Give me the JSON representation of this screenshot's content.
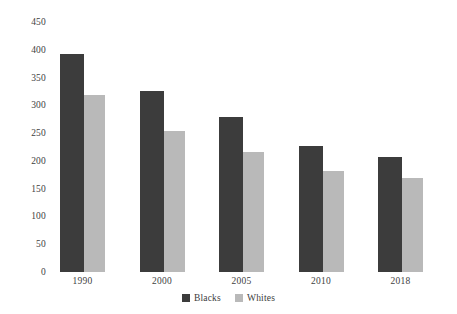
{
  "chart_data": {
    "type": "bar",
    "title": "",
    "subtitle": "",
    "xlabel": "",
    "ylabel": "",
    "categories": [
      "1990",
      "2000",
      "2005",
      "2010",
      "2018"
    ],
    "series": [
      {
        "name": "Blacks",
        "color": "#3c3c3c",
        "values": [
          393,
          325,
          279,
          226,
          207
        ]
      },
      {
        "name": "Whites",
        "color": "#b9b9b9",
        "values": [
          319,
          253,
          216,
          181,
          169
        ]
      }
    ],
    "ylim": [
      0,
      450
    ],
    "ytick_step": 50,
    "yticks": [
      "450",
      "400",
      "350",
      "300",
      "250",
      "200",
      "150",
      "100",
      "50",
      "0"
    ],
    "grid": false,
    "legend_position": "bottom",
    "legend": [
      "Blacks",
      "Whites"
    ]
  },
  "colors": {
    "background": "#ffffff",
    "text": "#3b3b3b",
    "blacks_bar": "#3c3c3c",
    "whites_bar": "#b9b9b9"
  }
}
